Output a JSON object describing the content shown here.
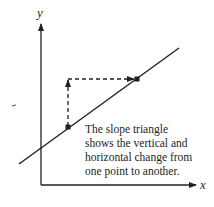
{
  "diagram": {
    "axes": {
      "x_label": "x",
      "y_label": "y"
    },
    "caption_lines": [
      "The slope triangle",
      "shows the vertical and",
      "horizontal change from",
      "one point to another."
    ],
    "points": [
      {
        "name": "point-1",
        "x": 68,
        "y": 127
      },
      {
        "name": "point-2",
        "x": 137,
        "y": 79
      }
    ],
    "colors": {
      "ink": "#231f20",
      "background": "#ffffff"
    }
  }
}
